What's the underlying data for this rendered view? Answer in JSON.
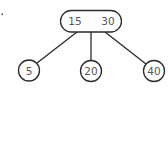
{
  "diagram": {
    "type": "2-3 tree",
    "root": {
      "keys": [
        "15",
        "30"
      ]
    },
    "children": [
      {
        "key": "5"
      },
      {
        "key": "20"
      },
      {
        "key": "40"
      }
    ],
    "colors": {
      "stroke": "#2a2a2a",
      "text": "#555555",
      "background": "#ffffff"
    }
  }
}
